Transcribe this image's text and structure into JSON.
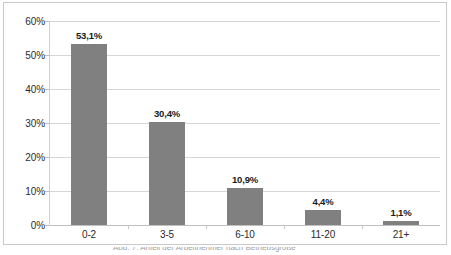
{
  "chart_data": {
    "type": "bar",
    "title": "",
    "xlabel": "",
    "ylabel": "",
    "categories": [
      "0-2",
      "3-5",
      "6-10",
      "11-20",
      "21+"
    ],
    "values": [
      53.1,
      30.4,
      10.9,
      4.4,
      1.1
    ],
    "value_labels": [
      "53,1%",
      "30,4%",
      "10,9%",
      "4,4%",
      "1,1%"
    ],
    "ylim": [
      0,
      60
    ],
    "ytick_values": [
      0,
      10,
      20,
      30,
      40,
      50,
      60
    ],
    "ytick_labels": [
      "0%",
      "10%",
      "20%",
      "30%",
      "40%",
      "50%",
      "60%"
    ],
    "grid": true,
    "legend": false,
    "legend_position": "none",
    "bar_color": "#808080",
    "gridline_color": "#d6d6d6",
    "frame_color": "#c9c9c9",
    "label_color": "#2b2b2b"
  },
  "footer": {
    "clipped_caption": "Abb. 7: Anteil der Arbeitnehmer nach Betriebsgröße"
  }
}
